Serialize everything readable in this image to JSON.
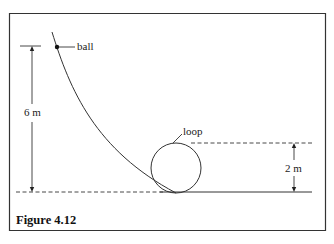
{
  "figure": {
    "caption": "Figure 4.12",
    "labels": {
      "ball": "ball",
      "loop": "loop",
      "height_start": "6 m",
      "height_loop": "2 m"
    },
    "colors": {
      "line": "#333333",
      "background": "#ffffff"
    }
  }
}
